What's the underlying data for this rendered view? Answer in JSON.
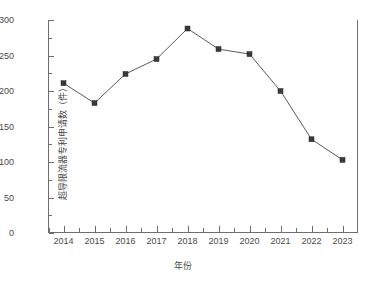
{
  "chart_data": {
    "type": "line",
    "title": "",
    "xlabel": "年份",
    "ylabel": "超导限流器专利申请数（件）",
    "categories": [
      "2014",
      "2015",
      "2016",
      "2017",
      "2018",
      "2019",
      "2020",
      "2021",
      "2022",
      "2023"
    ],
    "x": [
      2014,
      2015,
      2016,
      2017,
      2018,
      2019,
      2020,
      2021,
      2022,
      2023
    ],
    "values": [
      211,
      183,
      224,
      245,
      288,
      259,
      252,
      200,
      132,
      103
    ],
    "series": [
      {
        "name": "超导限流器专利申请数",
        "values": [
          211,
          183,
          224,
          245,
          288,
          259,
          252,
          200,
          132,
          103
        ]
      }
    ],
    "xlim": [
      2013.5,
      2023.5
    ],
    "ylim": [
      0,
      300
    ],
    "ytick_labels": [
      "0",
      "50",
      "100",
      "150",
      "200",
      "250",
      "300"
    ],
    "ytick_values": [
      0,
      50,
      100,
      150,
      200,
      250,
      300
    ],
    "yminor_step": 25,
    "xtick_labels": [
      "2014",
      "2015",
      "2016",
      "2017",
      "2018",
      "2019",
      "2020",
      "2021",
      "2022",
      "2023"
    ],
    "grid": false,
    "legend": null,
    "legend_position": "none",
    "marker": "square",
    "line_color": "#5a5a5a",
    "marker_color": "#3a3a3a",
    "axis_color": "#6e6e6e",
    "background": "#ffffff"
  }
}
